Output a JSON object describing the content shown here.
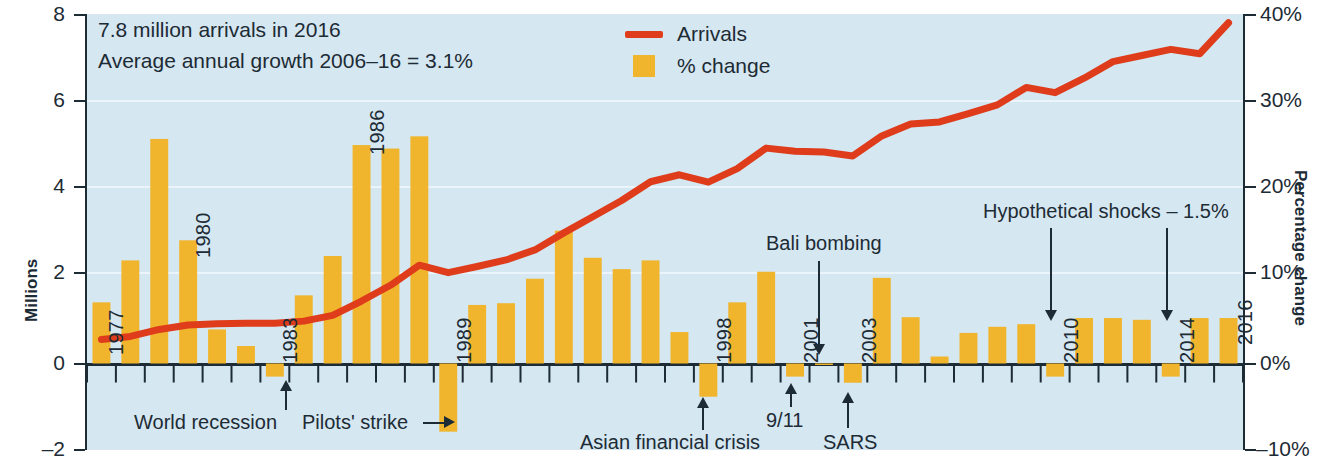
{
  "chart_data": {
    "type": "bar",
    "title": "",
    "subtitle": "",
    "annotation_lines": [
      "7.8 million arrivals in 2016",
      "Average annual growth 2006–16 = 3.1%"
    ],
    "xlabel": "",
    "ylabel": "Millions",
    "y2label": "Percentage change",
    "ylim": [
      -2,
      8
    ],
    "y2lim": [
      -10,
      40
    ],
    "yticks": [
      "8",
      "6",
      "4",
      "2",
      "0",
      "–2"
    ],
    "y2ticks": [
      "40%",
      "30%",
      "20%",
      "10%",
      "0%",
      "–10%"
    ],
    "grid": true,
    "legend_position": "top-center",
    "legend": [
      {
        "name": "Arrivals",
        "type": "line",
        "color": "#df3c1c"
      },
      {
        "name": "% change",
        "type": "bar",
        "color": "#f0b52c"
      }
    ],
    "categories": [
      1977,
      1978,
      1979,
      1980,
      1981,
      1982,
      1983,
      1984,
      1985,
      1986,
      1987,
      1988,
      1989,
      1990,
      1991,
      1992,
      1993,
      1994,
      1995,
      1996,
      1997,
      1998,
      1999,
      2000,
      2001,
      2002,
      2003,
      2004,
      2005,
      2006,
      2007,
      2008,
      2009,
      2010,
      2011,
      2012,
      2013,
      2014,
      2015,
      2016
    ],
    "series": [
      {
        "name": "% change",
        "type": "bar",
        "color": "#f0b52c",
        "unit": "%",
        "values": [
          7.0,
          11.8,
          25.7,
          14.1,
          3.9,
          2.0,
          -1.5,
          7.8,
          12.3,
          25.0,
          24.6,
          26.0,
          -7.8,
          6.7,
          6.9,
          9.7,
          15.2,
          12.1,
          10.8,
          11.8,
          3.6,
          -3.8,
          7.0,
          10.5,
          -1.5,
          0.0,
          -2.2,
          9.8,
          5.3,
          0.8,
          3.5,
          4.2,
          4.5,
          -1.5,
          5.2,
          5.2,
          5.0,
          -1.5,
          5.2,
          5.2
        ]
      },
      {
        "name": "Arrivals",
        "type": "line",
        "color": "#df3c1c",
        "unit": "millions",
        "values": [
          0.55,
          0.62,
          0.78,
          0.88,
          0.91,
          0.92,
          0.92,
          0.97,
          1.1,
          1.43,
          1.79,
          2.25,
          2.08,
          2.22,
          2.37,
          2.6,
          2.99,
          3.36,
          3.73,
          4.16,
          4.32,
          4.15,
          4.46,
          4.93,
          4.86,
          4.84,
          4.75,
          5.21,
          5.48,
          5.53,
          5.72,
          5.92,
          6.32,
          6.2,
          6.53,
          6.91,
          7.05,
          7.19,
          7.09,
          7.8
        ]
      }
    ],
    "point_labels": [
      {
        "year": 1977,
        "text": "1977"
      },
      {
        "year": 1980,
        "text": "1980"
      },
      {
        "year": 1983,
        "text": "1983"
      },
      {
        "year": 1986,
        "text": "1986"
      },
      {
        "year": 1989,
        "text": "1989"
      },
      {
        "year": 1998,
        "text": "1998"
      },
      {
        "year": 2001,
        "text": "2001"
      },
      {
        "year": 2003,
        "text": "2003"
      },
      {
        "year": 2010,
        "text": "2010"
      },
      {
        "year": 2014,
        "text": "2014"
      },
      {
        "year": 2016,
        "text": "2016"
      }
    ],
    "annotations": [
      {
        "id": "world-recession",
        "text": "World recession",
        "target_year": 1983,
        "position": "below"
      },
      {
        "id": "pilots-strike",
        "text": "Pilots' strike",
        "target_year": 1989,
        "position": "below-left"
      },
      {
        "id": "asian-financial-crisis",
        "text": "Asian financial crisis",
        "target_year": 1998,
        "position": "below"
      },
      {
        "id": "nine-eleven",
        "text": "9/11",
        "target_year": 2001,
        "position": "below"
      },
      {
        "id": "sars",
        "text": "SARS",
        "target_year": 2003,
        "position": "below"
      },
      {
        "id": "bali-bombing",
        "text": "Bali bombing",
        "target_year": 2002,
        "position": "above"
      },
      {
        "id": "hypothetical-shocks",
        "text": "Hypothetical shocks – 1.5%",
        "target_years": [
          2010,
          2014
        ],
        "position": "above"
      }
    ]
  },
  "axes": {
    "left_title": "Millions",
    "right_title": "Percentage change",
    "left_ticks": [
      "8",
      "6",
      "4",
      "2",
      "0",
      "–2"
    ],
    "right_ticks": [
      "40%",
      "30%",
      "20%",
      "10%",
      "0%",
      "–10%"
    ]
  },
  "header": {
    "line1": "7.8 million arrivals in 2016",
    "line2": "Average annual growth 2006–16 = 3.1%"
  },
  "legend": {
    "arrivals": "Arrivals",
    "change": "% change"
  },
  "labels": {
    "y1977": "1977",
    "y1980": "1980",
    "y1983": "1983",
    "y1986": "1986",
    "y1989": "1989",
    "y1998": "1998",
    "y2001": "2001",
    "y2003": "2003",
    "y2010": "2010",
    "y2014": "2014",
    "y2016": "2016"
  },
  "notes": {
    "world_recession": "World recession",
    "pilots_strike": "Pilots' strike",
    "asian_crisis": "Asian financial crisis",
    "nine_eleven": "9/11",
    "sars": "SARS",
    "bali": "Bali bombing",
    "hypothetical": "Hypothetical shocks – 1.5%"
  },
  "colors": {
    "bar": "#f0b52c",
    "line": "#df3c1c",
    "plot_bg": "#d5e7f1",
    "ink": "#1d2b35"
  }
}
